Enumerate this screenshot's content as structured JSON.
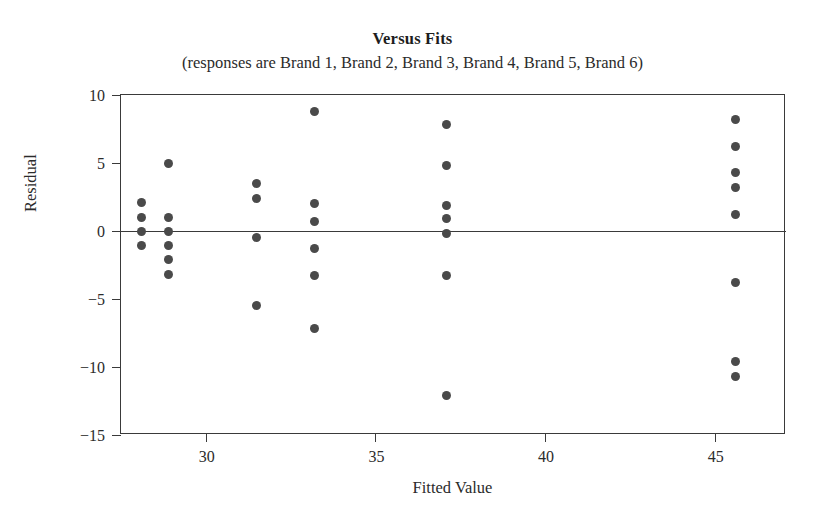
{
  "chart_data": {
    "type": "scatter",
    "title": "Versus Fits",
    "subtitle": "(responses are Brand 1, Brand 2, Brand 3, Brand 4, Brand 5, Brand 6)",
    "xlabel": "Fitted Value",
    "ylabel": "Residual",
    "xlim": [
      27.5,
      47.1
    ],
    "ylim": [
      -15,
      10
    ],
    "xticks": [
      30,
      35,
      40,
      45
    ],
    "yticks": [
      10,
      5,
      0,
      -5,
      -10,
      -15
    ],
    "grid": false,
    "legend": null,
    "reference_line": {
      "orientation": "horizontal",
      "y": 0
    },
    "marker": {
      "shape": "circle",
      "color": "#4a4a4a",
      "size": 9
    },
    "points": [
      {
        "x": 28.1,
        "y": 2.1
      },
      {
        "x": 28.1,
        "y": 1.0
      },
      {
        "x": 28.1,
        "y": 0.0
      },
      {
        "x": 28.1,
        "y": -1.1
      },
      {
        "x": 28.9,
        "y": 5.0
      },
      {
        "x": 28.9,
        "y": 1.0
      },
      {
        "x": 28.9,
        "y": 0.0
      },
      {
        "x": 28.9,
        "y": -1.1
      },
      {
        "x": 28.9,
        "y": -2.1
      },
      {
        "x": 28.9,
        "y": -3.2
      },
      {
        "x": 31.5,
        "y": 3.5
      },
      {
        "x": 31.5,
        "y": 2.4
      },
      {
        "x": 31.5,
        "y": -0.5
      },
      {
        "x": 31.5,
        "y": -5.5
      },
      {
        "x": 33.2,
        "y": 8.8
      },
      {
        "x": 33.2,
        "y": 2.0
      },
      {
        "x": 33.2,
        "y": 0.7
      },
      {
        "x": 33.2,
        "y": -1.3
      },
      {
        "x": 33.2,
        "y": -3.3
      },
      {
        "x": 33.2,
        "y": -7.2
      },
      {
        "x": 37.1,
        "y": 7.8
      },
      {
        "x": 37.1,
        "y": 4.8
      },
      {
        "x": 37.1,
        "y": 1.9
      },
      {
        "x": 37.1,
        "y": 0.9
      },
      {
        "x": 37.1,
        "y": -0.2
      },
      {
        "x": 37.1,
        "y": -3.3
      },
      {
        "x": 37.1,
        "y": -12.1
      },
      {
        "x": 45.6,
        "y": 8.2
      },
      {
        "x": 45.6,
        "y": 6.2
      },
      {
        "x": 45.6,
        "y": 4.3
      },
      {
        "x": 45.6,
        "y": 3.2
      },
      {
        "x": 45.6,
        "y": 1.2
      },
      {
        "x": 45.6,
        "y": -3.8
      },
      {
        "x": 45.6,
        "y": -9.6
      },
      {
        "x": 45.6,
        "y": -10.7
      }
    ]
  }
}
